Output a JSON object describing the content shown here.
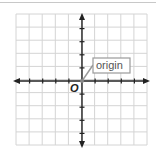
{
  "diagram": {
    "type": "coordinate-plane",
    "grid": {
      "columns": 10,
      "rows": 10
    },
    "axes": {
      "x_arrows": "both",
      "y_arrows": "both"
    },
    "origin_label": "O",
    "callout_label": "origin",
    "colors": {
      "grid": "#d4d4d4",
      "axis": "#222222",
      "callout_border": "#9a9a9a",
      "callout_text": "#555555",
      "origin_point": "#888888"
    }
  }
}
